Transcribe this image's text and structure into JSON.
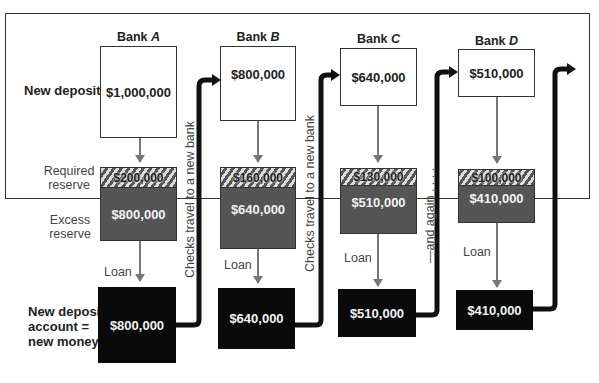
{
  "row_labels": {
    "new_deposits": "New deposits",
    "required_reserve": [
      "Required",
      "reserve"
    ],
    "excess_reserve": [
      "Excess",
      "reserve"
    ],
    "new_money": [
      "New deposit",
      "account =",
      "new money"
    ]
  },
  "banks": [
    {
      "name": "Bank",
      "letter": "A",
      "deposit": "$1,000,000",
      "required": "$200,000",
      "excess": "$800,000",
      "loan_label": "Loan",
      "new_money": "$800,000"
    },
    {
      "name": "Bank",
      "letter": "B",
      "deposit": "$800,000",
      "required": "$160,000",
      "excess": "$640,000",
      "loan_label": "Loan",
      "new_money": "$640,000"
    },
    {
      "name": "Bank",
      "letter": "C",
      "deposit": "$640,000",
      "required": "$130,000",
      "excess": "$510,000",
      "loan_label": "Loan",
      "new_money": "$510,000"
    },
    {
      "name": "Bank",
      "letter": "D",
      "deposit": "$510,000",
      "required": "$100,000",
      "excess": "$410,000",
      "loan_label": "Loan",
      "new_money": "$410,000"
    }
  ],
  "flow_labels": {
    "checks_travel_1": "Checks travel to a new bank",
    "checks_travel_2": "Checks travel to a new bank",
    "and_again": "—and again . . . ."
  },
  "colors": {
    "deposit_fill": "#ffffff",
    "excess_fill": "#555555",
    "new_money_fill": "#0a0a0a",
    "flow_arrow": "#111111",
    "loan_arrow": "#777777"
  }
}
